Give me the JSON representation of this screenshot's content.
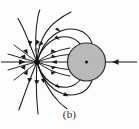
{
  "figure": {
    "caption": "(b)",
    "charge_label": "q",
    "colors": {
      "line": "#1a1a1a",
      "sphere_fill": "#b9b9b9",
      "sphere_stroke": "#2a2a2a",
      "background": "#fdfdfd"
    },
    "point_charge": {
      "name": "point-charge",
      "x": 37,
      "y": 62,
      "radius": 2.6,
      "sign": "negative"
    },
    "sphere": {
      "name": "conducting-sphere",
      "cx": 86.5,
      "cy": 62,
      "r": 19,
      "center_dot_r": 1.6
    },
    "axis": {
      "left_segment": {
        "x1": 1,
        "y1": 62,
        "x2": 34,
        "y2": 62,
        "arrow_dir": "right",
        "arrow_x": 24,
        "arrow_y": 62
      },
      "right_segment": {
        "x1": 137,
        "y1": 62,
        "x2": 106,
        "y2": 62,
        "arrow_dir": "left",
        "arrow_x": 118,
        "arrow_y": 62
      }
    },
    "field_lines": {
      "count_inner_horizontal": 5,
      "count_curved_to_sphere": 4,
      "count_escaping": 8,
      "arrow_direction": "toward-charge"
    }
  }
}
